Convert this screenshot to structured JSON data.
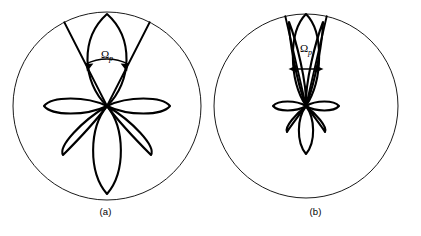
{
  "figure": {
    "type": "antenna-radiation-pattern-diagram",
    "background_color": "#ffffff",
    "line_color": "#000000",
    "panels": [
      {
        "id": "a",
        "caption": "(a)",
        "angle_label": "Ω",
        "angle_subscript": "p",
        "circle": {
          "cx": 107,
          "cy": 106,
          "r": 94
        },
        "wedge": {
          "half_angle_deg": 27,
          "apex_x": 107,
          "apex_y": 106
        },
        "arc_arrow": {
          "radius": 47,
          "both_ends": true
        },
        "main_lobe": {
          "length": 92,
          "half_width": 18,
          "direction_deg": 90
        },
        "side_lobes": [
          {
            "direction_deg": 180,
            "length": 63,
            "half_width": 11
          },
          {
            "direction_deg": 0,
            "length": 63,
            "half_width": 11
          },
          {
            "direction_deg": 235,
            "length": 58,
            "half_width": 12
          },
          {
            "direction_deg": 305,
            "length": 58,
            "half_width": 12
          },
          {
            "direction_deg": 270,
            "length": 88,
            "half_width": 13
          }
        ]
      },
      {
        "id": "b",
        "caption": "(b)",
        "angle_label": "Ω",
        "angle_subscript": "p",
        "circle": {
          "cx": 96,
          "cy": 106,
          "r": 92
        },
        "wedge": {
          "half_angle_deg": 13,
          "apex_x": 96,
          "apex_y": 106
        },
        "arc_arrow": {
          "radius": 0,
          "both_ends": true,
          "style": "horizontal-line"
        },
        "main_lobe": {
          "length": 92,
          "half_width": 12,
          "direction_deg": 90
        },
        "side_lobes": [
          {
            "direction_deg": 180,
            "length": 30,
            "half_width": 6
          },
          {
            "direction_deg": 0,
            "length": 30,
            "half_width": 6
          },
          {
            "direction_deg": 232,
            "length": 30,
            "half_width": 6
          },
          {
            "direction_deg": 308,
            "length": 30,
            "half_width": 6
          },
          {
            "direction_deg": 270,
            "length": 47,
            "half_width": 7
          },
          {
            "direction_deg": 100,
            "length": 84,
            "half_width": 6
          },
          {
            "direction_deg": 80,
            "length": 84,
            "half_width": 6
          }
        ]
      }
    ]
  }
}
